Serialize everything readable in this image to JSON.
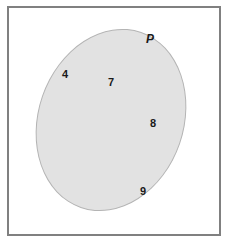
{
  "diagram": {
    "type": "venn-set-diagram",
    "universe": {
      "name": "universal-set-rectangle",
      "border_color": "#808080",
      "fill_color": "#ffffff"
    },
    "sets": [
      {
        "label": "P",
        "fill_color": "#e2e2e2",
        "border_color": "#b4b4b4",
        "shape": "ellipse",
        "rotation_deg": 19
      }
    ],
    "elements": [
      {
        "value": "4",
        "set": "P",
        "x": 65,
        "y": 74
      },
      {
        "value": "7",
        "set": "P",
        "x": 111,
        "y": 82
      },
      {
        "value": "8",
        "set": "P",
        "x": 153,
        "y": 123
      },
      {
        "value": "9",
        "set": "P",
        "x": 143,
        "y": 191
      }
    ],
    "set_label_position": {
      "x": 146,
      "y": 33
    }
  }
}
